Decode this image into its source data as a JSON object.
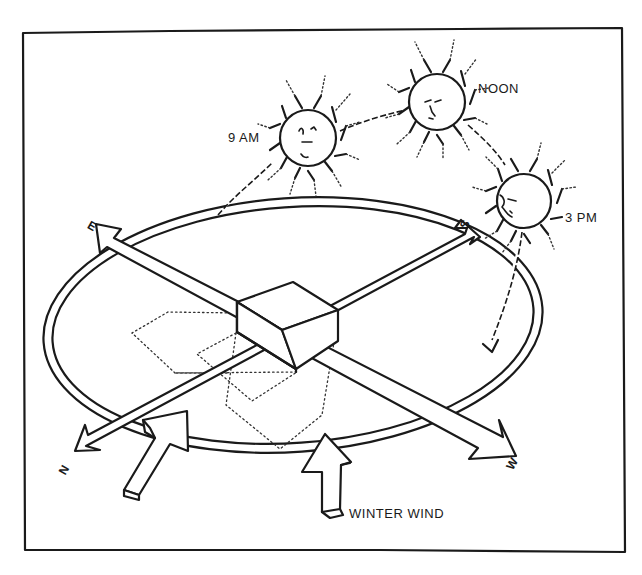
{
  "figure": {
    "ink_color": "#1a1a1a",
    "background": "#ffffff"
  },
  "suns": [
    {
      "label": "9 AM",
      "face": "smiling"
    },
    {
      "label": "NOON",
      "face": "sleepy"
    },
    {
      "label": "3 PM",
      "face": "profile"
    }
  ],
  "compass": {
    "north": "N",
    "south": "S",
    "east": "E",
    "west": "W"
  },
  "wind": {
    "label": "WINTER WIND"
  }
}
